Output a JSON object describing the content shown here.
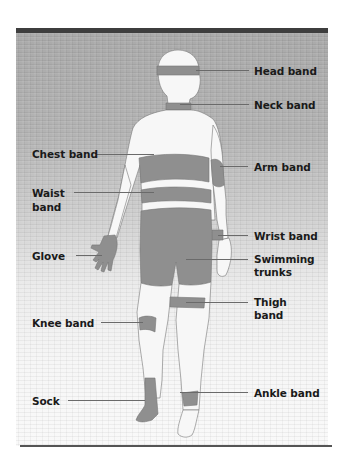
{
  "figure": {
    "panel_colors": {
      "top_bar": "#3e3e3e",
      "background_top": "#a9a9a9",
      "background_bottom": "#f9f9f9",
      "band_fill": "#8f8f8f",
      "skin_fill": "#f7f7f7",
      "bottom_rule": "#555555"
    },
    "labels": {
      "head_band": "Head band",
      "neck_band": "Neck band",
      "chest_band": "Chest band",
      "arm_band": "Arm band",
      "waist_band_line1": "Waist",
      "waist_band_line2": "band",
      "wrist_band": "Wrist band",
      "glove": "Glove",
      "swimming_trunks_line1": "Swimming",
      "swimming_trunks_line2": "trunks",
      "thigh_band_line1": "Thigh",
      "thigh_band_line2": "band",
      "knee_band": "Knee band",
      "sock": "Sock",
      "ankle_band": "Ankle band"
    }
  }
}
